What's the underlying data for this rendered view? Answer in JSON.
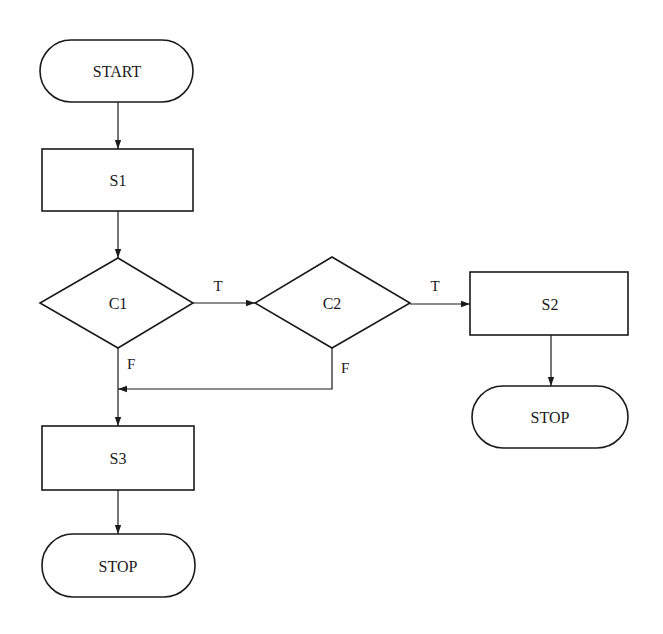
{
  "diagram": {
    "type": "flowchart",
    "nodes": {
      "start": {
        "label": "START",
        "shape": "terminal"
      },
      "s1": {
        "label": "S1",
        "shape": "process"
      },
      "c1": {
        "label": "C1",
        "shape": "decision"
      },
      "c2": {
        "label": "C2",
        "shape": "decision"
      },
      "s2": {
        "label": "S2",
        "shape": "process"
      },
      "stop_right": {
        "label": "STOP",
        "shape": "terminal"
      },
      "s3": {
        "label": "S3",
        "shape": "process"
      },
      "stop_bottom": {
        "label": "STOP",
        "shape": "terminal"
      }
    },
    "edges": [
      {
        "from": "start",
        "to": "s1",
        "label": ""
      },
      {
        "from": "s1",
        "to": "c1",
        "label": ""
      },
      {
        "from": "c1",
        "to": "c2",
        "label": "T"
      },
      {
        "from": "c2",
        "to": "s2",
        "label": "T"
      },
      {
        "from": "s2",
        "to": "stop_right",
        "label": ""
      },
      {
        "from": "c1",
        "to": "s3",
        "label": "F"
      },
      {
        "from": "c2",
        "to": "s3",
        "label": "F"
      },
      {
        "from": "s3",
        "to": "stop_bottom",
        "label": ""
      }
    ],
    "edge_labels": {
      "c1_true": "T",
      "c2_true": "T",
      "c1_false": "F",
      "c2_false": "F"
    }
  }
}
